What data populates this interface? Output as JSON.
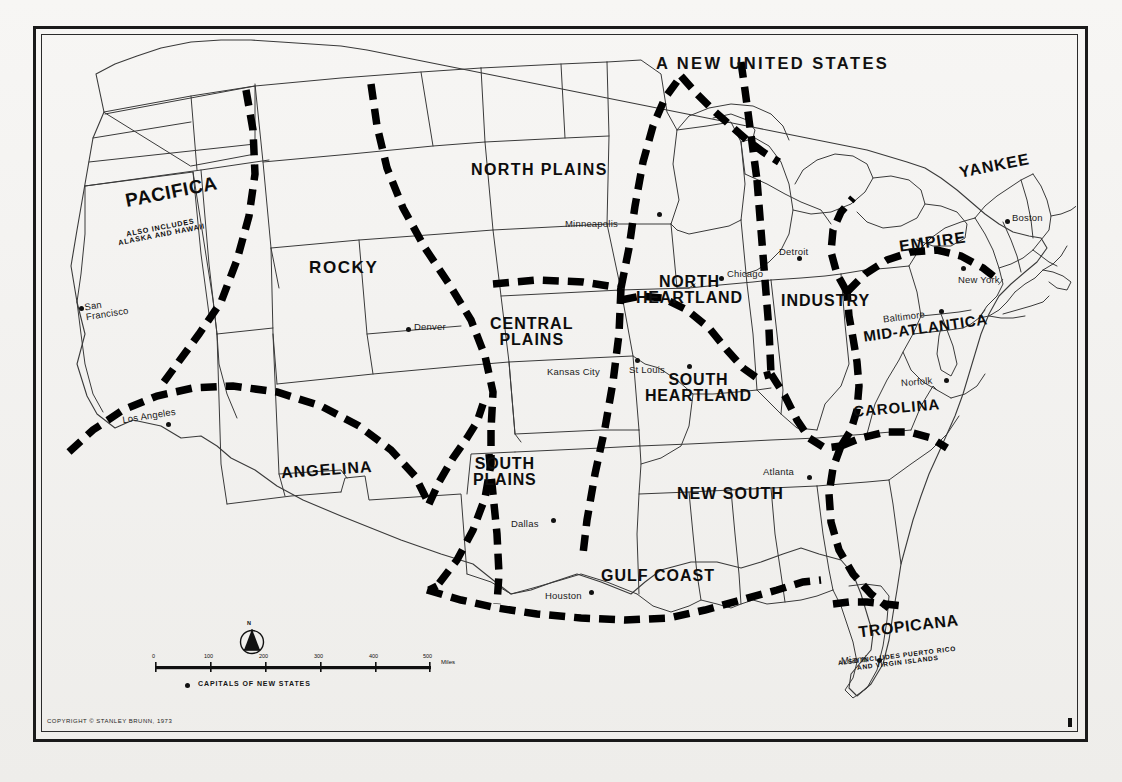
{
  "map": {
    "title": "A NEW UNITED STATES",
    "copyright": "COPYRIGHT © STANLEY BRUNN, 1973",
    "legend": {
      "capitals_label": "CAPITALS OF NEW STATES",
      "compass_label": "N",
      "scale_unit": "Miles",
      "scale_ticks": [
        "0",
        "100",
        "200",
        "300",
        "400",
        "500"
      ]
    },
    "regions": [
      {
        "name": "PACIFICA",
        "sub": "ALSO INCLUDES\nALASKA AND HAWAII"
      },
      {
        "name": "ROCKY",
        "sub": ""
      },
      {
        "name": "NORTH PLAINS",
        "sub": ""
      },
      {
        "name": "CENTRAL\nPLAINS",
        "sub": ""
      },
      {
        "name": "NORTH\nHEARTLAND",
        "sub": ""
      },
      {
        "name": "SOUTH\nHEARTLAND",
        "sub": ""
      },
      {
        "name": "INDUSTRY",
        "sub": ""
      },
      {
        "name": "YANKEE",
        "sub": ""
      },
      {
        "name": "EMPIRE",
        "sub": ""
      },
      {
        "name": "MID-ATLANTICA",
        "sub": ""
      },
      {
        "name": "CAROLINA",
        "sub": ""
      },
      {
        "name": "ANGELINA",
        "sub": ""
      },
      {
        "name": "SOUTH\nPLAINS",
        "sub": ""
      },
      {
        "name": "NEW SOUTH",
        "sub": ""
      },
      {
        "name": "GULF COAST",
        "sub": ""
      },
      {
        "name": "TROPICANA",
        "sub": "ALSO INCLUDES PUERTO RICO\nAND VIRGIN ISLANDS"
      }
    ],
    "cities": [
      {
        "name": "San\nFrancisco"
      },
      {
        "name": "Los Angeles"
      },
      {
        "name": "Denver"
      },
      {
        "name": "Minneapolis"
      },
      {
        "name": "Kansas City"
      },
      {
        "name": "St Louis"
      },
      {
        "name": "Chicago"
      },
      {
        "name": "Detroit"
      },
      {
        "name": "Boston"
      },
      {
        "name": "New York"
      },
      {
        "name": "Baltimore"
      },
      {
        "name": "Norfolk"
      },
      {
        "name": "Atlanta"
      },
      {
        "name": "Dallas"
      },
      {
        "name": "Houston"
      },
      {
        "name": "Miami"
      }
    ],
    "colors": {
      "ink": "#111111",
      "paper": "#f4f3f1",
      "boundary": "#000000"
    }
  }
}
